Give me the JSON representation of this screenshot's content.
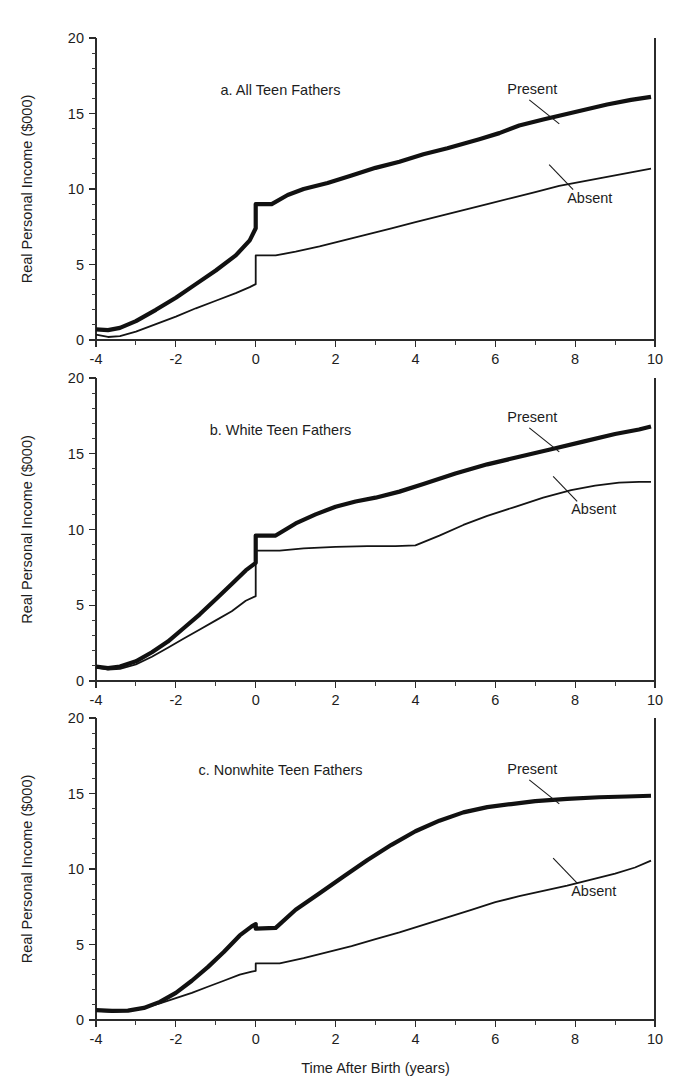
{
  "figure": {
    "width": 685,
    "height": 1084,
    "background": "#ffffff",
    "ink_color": "#111111",
    "shared_xlabel": "Time After Birth (years)",
    "shared_ylabel": "Real Personal Income ($000)"
  },
  "axes": {
    "x_ticks_major": [
      "-4",
      "-2",
      "0",
      "2",
      "4",
      "6",
      "8",
      "10"
    ],
    "x_tick_values": [
      -4,
      -2,
      0,
      2,
      4,
      6,
      8,
      10
    ],
    "x_minor_step": 1,
    "y_ticks_major": [
      "0",
      "5",
      "10",
      "15",
      "20"
    ],
    "y_tick_values": [
      0,
      5,
      10,
      15,
      20
    ],
    "y_minor_step": 1,
    "xlim": [
      -4,
      10
    ],
    "ylim": [
      0,
      20
    ]
  },
  "legend": {
    "present_label": "Present",
    "absent_label": "Absent"
  },
  "chart_data": [
    {
      "type": "line",
      "title": "a. All Teen Fathers",
      "panel_id": "a",
      "xlabel": "",
      "ylabel": "Real Personal Income ($000)",
      "xlim": [
        -4,
        10
      ],
      "ylim": [
        0,
        20
      ],
      "grid": false,
      "legend_position": "inline-annotation",
      "discontinuity_at": 0,
      "annotations": [
        {
          "text": "Present",
          "x": 6.3,
          "y": 16.3
        },
        {
          "text": "Absent",
          "x": 7.8,
          "y": 9.1
        }
      ],
      "series": [
        {
          "name": "Present",
          "style": "thick",
          "x": [
            -4,
            -3.7,
            -3.4,
            -3,
            -2.5,
            -2,
            -1.5,
            -1,
            -0.5,
            -0.15,
            0,
            0.4,
            0.8,
            1.2,
            1.8,
            2.4,
            3,
            3.6,
            4.2,
            4.8,
            5.2,
            5.6,
            6.1,
            6.6,
            7.2,
            8,
            8.8,
            9.4,
            9.9
          ],
          "values": [
            0.7,
            0.65,
            0.8,
            1.25,
            2.0,
            2.8,
            3.7,
            4.6,
            5.6,
            6.6,
            7.4,
            9.0,
            9.6,
            10.0,
            10.4,
            10.9,
            11.4,
            11.8,
            12.3,
            12.7,
            13.0,
            13.3,
            13.7,
            14.2,
            14.6,
            15.1,
            15.6,
            15.9,
            16.1
          ],
          "jump": {
            "x": 0,
            "from": 7.4,
            "to": 9.0
          }
        },
        {
          "name": "Absent",
          "style": "thin",
          "x": [
            -4,
            -3.7,
            -3.4,
            -3,
            -2.5,
            -2,
            -1.5,
            -1,
            -0.5,
            -0.15,
            0,
            0.5,
            1,
            1.6,
            2.2,
            2.8,
            3.4,
            4,
            4.6,
            5.2,
            5.8,
            6.4,
            7,
            7.6,
            8.2,
            8.8,
            9.4,
            9.9
          ],
          "values": [
            0.35,
            0.2,
            0.25,
            0.55,
            1.05,
            1.55,
            2.1,
            2.6,
            3.1,
            3.5,
            3.7,
            5.6,
            5.85,
            6.2,
            6.6,
            7.0,
            7.4,
            7.8,
            8.2,
            8.6,
            9.0,
            9.4,
            9.8,
            10.2,
            10.5,
            10.8,
            11.1,
            11.35
          ],
          "jump": {
            "x": 0,
            "from": 3.7,
            "to": 5.6
          }
        }
      ]
    },
    {
      "type": "line",
      "title": "b. White Teen Fathers",
      "panel_id": "b",
      "xlabel": "",
      "ylabel": "Real Personal Income ($000)",
      "xlim": [
        -4,
        10
      ],
      "ylim": [
        0,
        20
      ],
      "grid": false,
      "legend_position": "inline-annotation",
      "discontinuity_at": 0,
      "annotations": [
        {
          "text": "Present",
          "x": 6.3,
          "y": 17.1
        },
        {
          "text": "Absent",
          "x": 7.9,
          "y": 11.0
        }
      ],
      "series": [
        {
          "name": "Present",
          "style": "thick",
          "x": [
            -4,
            -3.7,
            -3.4,
            -3,
            -2.6,
            -2.2,
            -1.8,
            -1.4,
            -1,
            -0.6,
            -0.25,
            0,
            0.5,
            1,
            1.5,
            2,
            2.5,
            3,
            3.6,
            4.2,
            5,
            5.8,
            6.6,
            7.4,
            8.2,
            9,
            9.6,
            9.9
          ],
          "values": [
            0.95,
            0.85,
            0.95,
            1.3,
            1.9,
            2.6,
            3.5,
            4.4,
            5.4,
            6.4,
            7.3,
            7.8,
            9.6,
            10.4,
            11.0,
            11.5,
            11.85,
            12.1,
            12.5,
            13.0,
            13.7,
            14.3,
            14.8,
            15.3,
            15.8,
            16.3,
            16.6,
            16.8
          ],
          "jump": {
            "x": 0,
            "from": 7.8,
            "to": 9.6
          }
        },
        {
          "name": "Absent",
          "style": "thin",
          "x": [
            -4,
            -3.7,
            -3.4,
            -3,
            -2.6,
            -2.2,
            -1.8,
            -1.4,
            -1,
            -0.6,
            -0.25,
            0,
            0.6,
            1.2,
            2,
            2.8,
            3.5,
            4,
            4.6,
            5.2,
            5.8,
            6.5,
            7.2,
            7.9,
            8.5,
            9.1,
            9.6,
            9.9
          ],
          "values": [
            0.9,
            0.75,
            0.8,
            1.1,
            1.6,
            2.2,
            2.8,
            3.4,
            4.0,
            4.6,
            5.3,
            5.6,
            8.6,
            8.75,
            8.85,
            8.9,
            8.9,
            8.95,
            9.6,
            10.3,
            10.9,
            11.5,
            12.1,
            12.6,
            12.9,
            13.1,
            13.15,
            13.15
          ],
          "jump": {
            "x": 0,
            "from": 5.6,
            "to": 8.6
          }
        }
      ]
    },
    {
      "type": "line",
      "title": "c. Nonwhite Teen Fathers",
      "panel_id": "c",
      "xlabel": "Time After Birth (years)",
      "ylabel": "Real Personal Income ($000)",
      "xlim": [
        -4,
        10
      ],
      "ylim": [
        0,
        20
      ],
      "grid": false,
      "legend_position": "inline-annotation",
      "discontinuity_at": 0,
      "annotations": [
        {
          "text": "Present",
          "x": 6.3,
          "y": 16.3
        },
        {
          "text": "Absent",
          "x": 7.9,
          "y": 8.2
        }
      ],
      "series": [
        {
          "name": "Present",
          "style": "thick",
          "x": [
            -4,
            -3.6,
            -3.2,
            -2.8,
            -2.4,
            -2,
            -1.6,
            -1.2,
            -0.8,
            -0.4,
            -0.1,
            0,
            0.5,
            1,
            1.6,
            2.2,
            2.8,
            3.4,
            4,
            4.6,
            5.2,
            5.8,
            6.4,
            7,
            7.8,
            8.6,
            9.3,
            9.9
          ],
          "values": [
            0.65,
            0.6,
            0.62,
            0.8,
            1.2,
            1.8,
            2.6,
            3.5,
            4.5,
            5.6,
            6.2,
            6.35,
            6.1,
            7.3,
            8.4,
            9.5,
            10.6,
            11.6,
            12.5,
            13.2,
            13.75,
            14.1,
            14.3,
            14.5,
            14.65,
            14.75,
            14.8,
            14.85
          ],
          "jump": {
            "x": 0,
            "from": 6.35,
            "to": 6.05
          }
        },
        {
          "name": "Absent",
          "style": "thin",
          "x": [
            -4,
            -3.6,
            -3.2,
            -2.8,
            -2.4,
            -2,
            -1.6,
            -1.2,
            -0.8,
            -0.4,
            -0.1,
            0,
            0.6,
            1.2,
            1.8,
            2.4,
            3,
            3.6,
            4.2,
            4.8,
            5.4,
            6,
            6.6,
            7.2,
            7.8,
            8.4,
            9,
            9.5,
            9.9
          ],
          "values": [
            0.6,
            0.55,
            0.6,
            0.8,
            1.1,
            1.45,
            1.8,
            2.2,
            2.6,
            3.0,
            3.2,
            3.25,
            3.75,
            4.1,
            4.5,
            4.9,
            5.35,
            5.8,
            6.3,
            6.8,
            7.3,
            7.8,
            8.2,
            8.55,
            8.9,
            9.3,
            9.7,
            10.1,
            10.55
          ],
          "jump": {
            "x": 0,
            "from": 3.25,
            "to": 3.75
          }
        }
      ]
    }
  ],
  "panel_geometry": [
    {
      "id": "a",
      "left": 96,
      "right": 655,
      "top": 38,
      "bottom": 340
    },
    {
      "id": "b",
      "left": 96,
      "right": 655,
      "top": 378,
      "bottom": 681
    },
    {
      "id": "c",
      "left": 96,
      "right": 655,
      "top": 718,
      "bottom": 1020
    }
  ]
}
